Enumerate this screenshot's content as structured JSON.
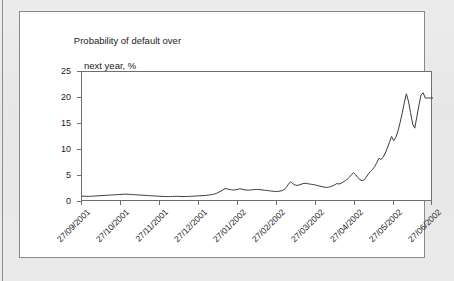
{
  "figure": {
    "panel_background": "#ffffff",
    "page_background": "#e9e9e9",
    "border_color": "#8a8a8a"
  },
  "chart_data": {
    "type": "line",
    "title": "Probability of default over",
    "title_line_2": "next year, %",
    "xlabel": "",
    "ylabel": "",
    "ylim": [
      0,
      25
    ],
    "yticks": [
      0,
      5,
      10,
      15,
      20,
      25
    ],
    "ytick_labels": [
      "0",
      "5",
      "10",
      "15",
      "20",
      "25"
    ],
    "grid": false,
    "legend": "none",
    "line_color": "#3a3a3a",
    "categories": [
      "27/09/2001",
      "27/10/2001",
      "27/11/2001",
      "27/12/2001",
      "27/01/2002",
      "27/02/2002",
      "27/03/2002",
      "27/04/2002",
      "27/05/2002",
      "27/06/2002"
    ],
    "xtick_labels": [
      "27/09/2001",
      "27/10/2001",
      "27/11/2001",
      "27/12/2001",
      "27/01/2002",
      "27/02/2002",
      "27/03/2002",
      "27/04/2002",
      "27/05/2002",
      "27/06/2002"
    ],
    "series": [
      {
        "name": "Probability of default over next year, %",
        "x": [
          0.0,
          0.6,
          1.2,
          1.8,
          2.4,
          3.0,
          3.6,
          4.2,
          4.8,
          5.4,
          6.0,
          6.6,
          7.2,
          7.8,
          8.4,
          9.0,
          9.6,
          10.2,
          10.8,
          11.4,
          12.0,
          12.6,
          13.2,
          13.8,
          14.4,
          15.0,
          15.6,
          16.2,
          16.8,
          17.4,
          18.0,
          18.6,
          19.2,
          19.8,
          20.4,
          21.0,
          21.6,
          22.2,
          22.8,
          23.4,
          24.0,
          24.6,
          25.2,
          25.8,
          26.4,
          27.0,
          27.6,
          28.2,
          28.8,
          29.4,
          30.0,
          30.6,
          31.2,
          31.8,
          32.4,
          33.0,
          33.6,
          34.2,
          34.8,
          35.4,
          36.0,
          36.6,
          37.2,
          37.8,
          38.4,
          39.0,
          39.6,
          40.2,
          40.8,
          41.4,
          42.0,
          42.6,
          43.2,
          43.8,
          44.4,
          45.0,
          45.6,
          46.2,
          46.8,
          47.4,
          48.0,
          48.6,
          49.2,
          49.8,
          50.4,
          51.0,
          51.6,
          52.2,
          52.8,
          53.4,
          54.0,
          54.6,
          55.2,
          55.8,
          56.4,
          57.0,
          57.6,
          58.2,
          58.8,
          59.4,
          60.0,
          60.6,
          61.2,
          61.8,
          62.4,
          63.0,
          63.6,
          64.2,
          64.8,
          65.4,
          66.0,
          66.6,
          67.2,
          67.8,
          68.4,
          69.0,
          69.6,
          70.2,
          70.8,
          71.4,
          72.0,
          72.6,
          73.2,
          73.8,
          74.4,
          75.0,
          75.6,
          76.2,
          76.8,
          77.4,
          78.0,
          78.6,
          79.2,
          79.8,
          80.4,
          81.0,
          81.6,
          82.2,
          82.8,
          83.4,
          84.0,
          84.6,
          85.2,
          85.8,
          86.4,
          87.0,
          87.6,
          88.2,
          88.8,
          89.4,
          90.0,
          90.6,
          91.2,
          91.8,
          92.4,
          93.0,
          93.6,
          94.2,
          94.8,
          95.4,
          96.0,
          96.6,
          97.2,
          97.8,
          98.4,
          99.0,
          99.6,
          100.0
        ],
        "values": [
          1.1,
          1.12,
          1.1,
          1.08,
          1.1,
          1.12,
          1.15,
          1.18,
          1.2,
          1.22,
          1.25,
          1.28,
          1.3,
          1.32,
          1.35,
          1.38,
          1.4,
          1.42,
          1.45,
          1.48,
          1.5,
          1.5,
          1.48,
          1.45,
          1.42,
          1.4,
          1.38,
          1.35,
          1.32,
          1.3,
          1.28,
          1.25,
          1.22,
          1.2,
          1.18,
          1.15,
          1.12,
          1.1,
          1.08,
          1.06,
          1.05,
          1.04,
          1.05,
          1.06,
          1.08,
          1.1,
          1.08,
          1.06,
          1.05,
          1.05,
          1.06,
          1.08,
          1.1,
          1.12,
          1.15,
          1.18,
          1.2,
          1.22,
          1.25,
          1.28,
          1.32,
          1.38,
          1.45,
          1.55,
          1.7,
          1.9,
          2.1,
          2.35,
          2.6,
          2.5,
          2.4,
          2.35,
          2.3,
          2.35,
          2.45,
          2.55,
          2.45,
          2.35,
          2.3,
          2.28,
          2.3,
          2.35,
          2.4,
          2.42,
          2.4,
          2.35,
          2.3,
          2.25,
          2.2,
          2.15,
          2.1,
          2.05,
          2.02,
          2.05,
          2.1,
          2.2,
          2.4,
          2.8,
          3.4,
          3.9,
          3.55,
          3.3,
          3.2,
          3.25,
          3.4,
          3.55,
          3.6,
          3.55,
          3.45,
          3.4,
          3.35,
          3.25,
          3.15,
          3.05,
          2.95,
          2.85,
          2.8,
          2.85,
          2.95,
          3.1,
          3.3,
          3.55,
          3.45,
          3.6,
          3.85,
          4.1,
          4.4,
          4.8,
          5.3,
          5.6,
          5.2,
          4.7,
          4.3,
          4.1,
          4.3,
          4.8,
          5.4,
          5.9,
          6.3,
          6.8,
          7.6,
          8.4,
          8.2,
          8.6,
          9.4,
          10.4,
          11.5,
          12.6,
          11.8,
          12.4,
          13.6,
          15.2,
          17.0,
          19.0,
          20.8,
          19.4,
          17.2,
          15.0,
          14.2,
          16.4,
          18.6,
          20.6,
          21.0,
          20.0,
          20.0,
          20.0,
          20.0,
          20.0
        ]
      }
    ]
  }
}
